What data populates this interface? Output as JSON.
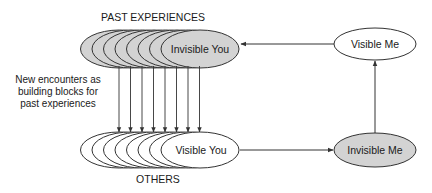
{
  "labels": {
    "past_experiences": "PAST EXPERIENCES",
    "others": "OTHERS",
    "note_lines": [
      "New encounters as",
      "building blocks for",
      "past experiences"
    ]
  },
  "nodes": {
    "invisible_you": "Invisible You",
    "visible_you": "Visible You",
    "visible_me": "Visible Me",
    "invisible_me": "Invisible Me"
  },
  "stack_count": 8,
  "encounter_arrow_count": 8,
  "colors": {
    "shaded_fill": "#d3d3d3",
    "plain_fill": "#ffffff",
    "stroke": "#333333",
    "text": "#1a1a1a"
  },
  "edges": [
    {
      "from": "visible_me",
      "to": "invisible_you"
    },
    {
      "from": "visible_you",
      "to": "invisible_me"
    },
    {
      "from": "invisible_me",
      "to": "visible_me"
    },
    {
      "from": "past_experiences",
      "to": "others",
      "label": "New encounters as building blocks for past experiences"
    }
  ]
}
